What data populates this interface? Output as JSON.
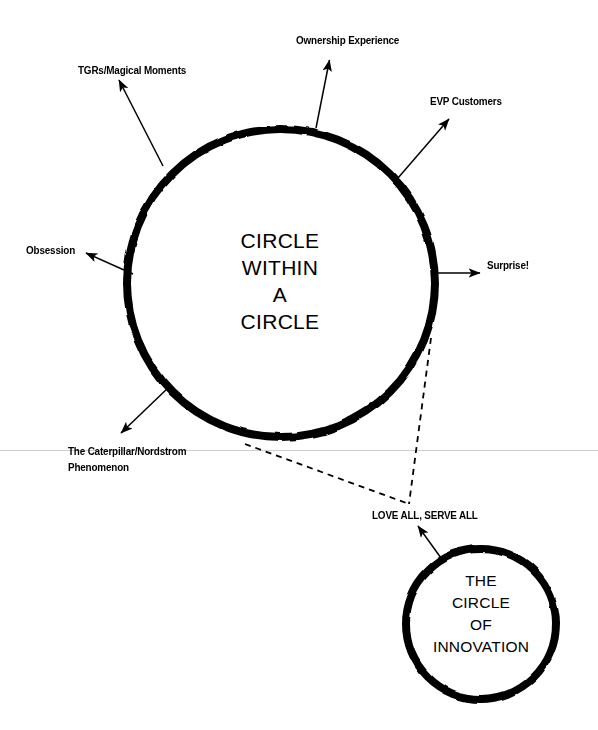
{
  "diagram": {
    "title": "Circle Within A Circle",
    "background_color": "#ffffff",
    "ink_color": "#000000",
    "fold_line_color": "#cccccc",
    "outer_circle": {
      "center_text": "CIRCLE\nWITHIN\nA\nCIRCLE",
      "cx": 281,
      "cy": 283,
      "r": 154,
      "stroke_width": 8
    },
    "inner_circle": {
      "center_text": "THE\nCIRCLE\nOF\nINNOVATION",
      "cx": 481,
      "cy": 624,
      "r": 75,
      "stroke_width": 8
    },
    "spokes": [
      {
        "label": "TGRs/Magical Moments",
        "direction": "up-left",
        "from": [
          163,
          166
        ],
        "to": [
          118,
          79
        ]
      },
      {
        "label": "Ownership Experience",
        "direction": "up",
        "from": [
          316,
          128
        ],
        "to": [
          330,
          59
        ]
      },
      {
        "label": "EVP Customers",
        "direction": "up-right",
        "from": [
          398,
          178
        ],
        "to": [
          450,
          118
        ]
      },
      {
        "label": "Obsession",
        "direction": "left",
        "from": [
          132,
          273
        ],
        "to": [
          85,
          253
        ]
      },
      {
        "label": "Surprise!",
        "direction": "right",
        "from": [
          432,
          273
        ],
        "to": [
          481,
          273
        ]
      },
      {
        "label": "The Caterpillar/Nordstrom\nPhenomenon",
        "direction": "down-left",
        "from": [
          168,
          388
        ],
        "to": [
          120,
          434
        ]
      },
      {
        "label": "LOVE ALL, SERVE ALL",
        "direction": "up",
        "from": [
          441,
          558
        ],
        "to": [
          417,
          525
        ]
      }
    ],
    "connector": {
      "style": "dashed",
      "vertex": [
        409,
        504
      ],
      "from_points": [
        [
          245,
          444
        ],
        [
          431,
          338
        ]
      ]
    }
  }
}
